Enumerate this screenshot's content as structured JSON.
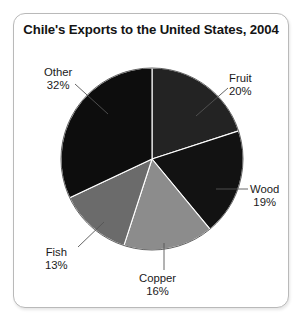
{
  "chart_data": {
    "type": "pie",
    "title": "Chile's Exports to the United States, 2004",
    "subtitle": "",
    "xlabel": "",
    "ylabel": "",
    "units": "percent",
    "legend_position": "none",
    "grid": false,
    "labels_show_percent": true,
    "start_angle_deg": 0,
    "direction": "clockwise",
    "categories": [
      "Fruit",
      "Wood",
      "Copper",
      "Fish",
      "Other"
    ],
    "values": [
      20,
      19,
      16,
      13,
      32
    ],
    "total": 100,
    "slices": [
      {
        "label": "Fruit",
        "value": 20,
        "percent_text": "20%",
        "color": "#232323",
        "start_deg": 0.0,
        "end_deg": 72.0
      },
      {
        "label": "Wood",
        "value": 19,
        "percent_text": "19%",
        "color": "#121212",
        "start_deg": 72.0,
        "end_deg": 140.4
      },
      {
        "label": "Copper",
        "value": 16,
        "percent_text": "16%",
        "color": "#8c8c8c",
        "start_deg": 140.4,
        "end_deg": 198.0
      },
      {
        "label": "Fish",
        "value": 13,
        "percent_text": "13%",
        "color": "#6b6b6b",
        "start_deg": 198.0,
        "end_deg": 244.8
      },
      {
        "label": "Other",
        "value": 32,
        "percent_text": "32%",
        "color": "#0d0d0d",
        "start_deg": 244.8,
        "end_deg": 360.0
      }
    ]
  },
  "frame": {
    "border_color": "#b9b9b9",
    "background": "#ffffff"
  },
  "labels": {
    "other": {
      "name": "Other",
      "percent": "32%"
    },
    "fruit": {
      "name": "Fruit",
      "percent": "20%"
    },
    "wood": {
      "name": "Wood",
      "percent": "19%"
    },
    "copper": {
      "name": "Copper",
      "percent": "16%"
    },
    "fish": {
      "name": "Fish",
      "percent": "13%"
    }
  }
}
